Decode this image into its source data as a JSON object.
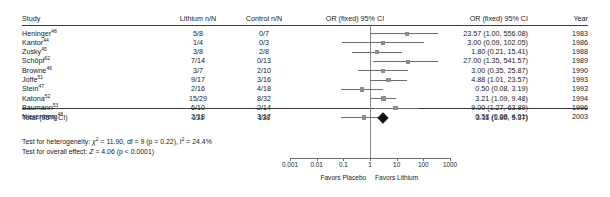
{
  "columns": {
    "study": "Study",
    "lithium": "Lithium n/N",
    "control": "Control n/N",
    "or_plot": "OR (fixed) 95% CI",
    "or_text": "OR (fixed) 95% CI",
    "year": "Year"
  },
  "rows": [
    {
      "study": "Heninger",
      "ref": "48",
      "lithium": "5/8",
      "control": "0/7",
      "or_text": "23.57 (1.00, 556.08)",
      "year": "1983",
      "or": 23.57,
      "lo": 1.0,
      "hi": 556.08,
      "weight": 0.055
    },
    {
      "study": "Kantor",
      "ref": "44",
      "lithium": "1/4",
      "control": "0/3",
      "or_text": "3.00 (0.09, 102.05)",
      "year": "1986",
      "or": 3.0,
      "lo": 0.09,
      "hi": 102.05,
      "weight": 0.05
    },
    {
      "study": "Zusky",
      "ref": "45",
      "lithium": "3/8",
      "control": "2/8",
      "or_text": "1.80 (0.21, 15.41)",
      "year": "1988",
      "or": 1.8,
      "lo": 0.21,
      "hi": 15.41,
      "weight": 0.075
    },
    {
      "study": "Schöpf",
      "ref": "62",
      "lithium": "7/14",
      "control": "0/13",
      "or_text": "27.00 (1.35, 541.57)",
      "year": "1989",
      "or": 27.0,
      "lo": 1.35,
      "hi": 541.57,
      "weight": 0.055
    },
    {
      "study": "Browne",
      "ref": "46",
      "lithium": "3/7",
      "control": "2/10",
      "or_text": "3.00 (0.35, 25.87)",
      "year": "1990",
      "or": 3.0,
      "lo": 0.35,
      "hi": 25.87,
      "weight": 0.075
    },
    {
      "study": "Joffe",
      "ref": "51",
      "lithium": "9/17",
      "control": "3/16",
      "or_text": "4.88 (1.01, 23.57)",
      "year": "1993",
      "or": 4.88,
      "lo": 1.01,
      "hi": 23.57,
      "weight": 0.095
    },
    {
      "study": "Stein",
      "ref": "47",
      "lithium": "2/16",
      "control": "4/18",
      "or_text": "0.50 (0.08, 3.19)",
      "year": "1993",
      "or": 0.5,
      "lo": 0.08,
      "hi": 3.19,
      "weight": 0.08
    },
    {
      "study": "Katona",
      "ref": "52",
      "lithium": "15/29",
      "control": "8/32",
      "or_text": "3.21 (1.09, 9.48)",
      "year": "1994",
      "or": 3.21,
      "lo": 1.09,
      "hi": 9.48,
      "weight": 0.12
    },
    {
      "study": "Baumann",
      "ref": "53",
      "lithium": "6/10",
      "control": "2/14",
      "or_text": "9.00 (1.27, 63.89)",
      "year": "1996",
      "or": 9.0,
      "lo": 1.27,
      "hi": 63.89,
      "weight": 0.08
    },
    {
      "study": "Nierenberg",
      "ref": "48",
      "lithium": "2/18",
      "control": "3/17",
      "or_text": "0.58 (0.08, 4.01)",
      "year": "2003",
      "or": 0.58,
      "lo": 0.08,
      "hi": 4.01,
      "weight": 0.08
    }
  ],
  "total": {
    "label": "Total (95% CI)",
    "lithium": "131",
    "control": "138",
    "or_text": "3.11 (1.80, 5.37)",
    "or": 3.11,
    "lo": 1.8,
    "hi": 5.37
  },
  "stats": {
    "heterogeneity_prefix": "Test for heterogeneity: ",
    "heterogeneity_chi": "χ",
    "heterogeneity_body": " = 11.90, df = 9 (p = 0.22), I",
    "heterogeneity_tail": " = 24.4%",
    "effect_prefix": "Test for overall effect: ",
    "effect_z": "Z",
    "effect_body": " = 4.06 (p < 0.0001)"
  },
  "axis": {
    "ticks": [
      "0.001",
      "0.01",
      "0.1",
      "1",
      "10",
      "100",
      "1000"
    ],
    "tick_values": [
      0.001,
      0.01,
      0.1,
      1,
      10,
      100,
      1000
    ],
    "min": 0.001,
    "max": 1000,
    "favors_left": "Favors Placebo",
    "favors_right": "Favors Lithium"
  },
  "chart_data": {
    "type": "forest",
    "title": "",
    "xlabel": "Odds Ratio (fixed) 95% CI, log scale",
    "xlim": [
      0.001,
      1000
    ],
    "null_line": 1,
    "categories": [
      "Heninger48",
      "Kantor44",
      "Zusky45",
      "Schöpf62",
      "Browne46",
      "Joffe51",
      "Stein47",
      "Katona52",
      "Baumann53",
      "Nierenberg48"
    ],
    "values": [
      23.57,
      3.0,
      1.8,
      27.0,
      3.0,
      4.88,
      0.5,
      3.21,
      9.0,
      0.58
    ],
    "ci_lower": [
      1.0,
      0.09,
      0.21,
      1.35,
      0.35,
      1.01,
      0.08,
      1.09,
      1.27,
      0.08
    ],
    "ci_upper": [
      556.08,
      102.05,
      15.41,
      541.57,
      25.87,
      23.57,
      3.19,
      9.48,
      63.89,
      4.01
    ],
    "lithium_events": [
      5,
      1,
      3,
      7,
      3,
      9,
      2,
      15,
      6,
      2
    ],
    "lithium_total": [
      8,
      4,
      8,
      14,
      7,
      17,
      16,
      29,
      10,
      18
    ],
    "control_events": [
      0,
      0,
      2,
      0,
      2,
      3,
      4,
      8,
      2,
      3
    ],
    "control_total": [
      7,
      3,
      8,
      13,
      10,
      16,
      18,
      32,
      14,
      17
    ],
    "years": [
      1983,
      1986,
      1988,
      1989,
      1990,
      1993,
      1993,
      1994,
      1996,
      2003
    ],
    "pooled": {
      "or": 3.11,
      "ci_lower": 1.8,
      "ci_upper": 5.37,
      "lithium_total": 131,
      "control_total": 138
    },
    "heterogeneity": {
      "chi2": 11.9,
      "df": 9,
      "p": 0.22,
      "i2_percent": 24.4
    },
    "overall_effect": {
      "z": 4.06,
      "p": "< 0.0001"
    },
    "grid": false,
    "legend": "none"
  }
}
